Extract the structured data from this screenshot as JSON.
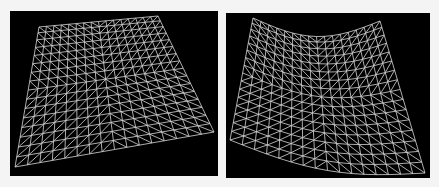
{
  "figure": {
    "background": "#f4f4f4",
    "panel_color": "#000000",
    "line_color": "#d8d8d8",
    "panels": [
      {
        "id": "left",
        "label": "flat-perspective-mesh",
        "rows": 16,
        "cols": 16,
        "corners": {
          "tl": [
            39,
            27
          ],
          "tr": [
            158,
            16
          ],
          "bl": [
            15,
            167
          ],
          "br": [
            214,
            132
          ]
        },
        "top_sag": 0,
        "bottom_sag": 0
      },
      {
        "id": "right",
        "label": "deformed-saddle-mesh",
        "rows": 16,
        "cols": 16,
        "corners": {
          "tl": [
            253,
            18
          ],
          "tr": [
            380,
            21
          ],
          "bl": [
            230,
            140
          ],
          "br": [
            425,
            173
          ]
        },
        "top_sag": 17,
        "bottom_sag": 14
      }
    ]
  }
}
